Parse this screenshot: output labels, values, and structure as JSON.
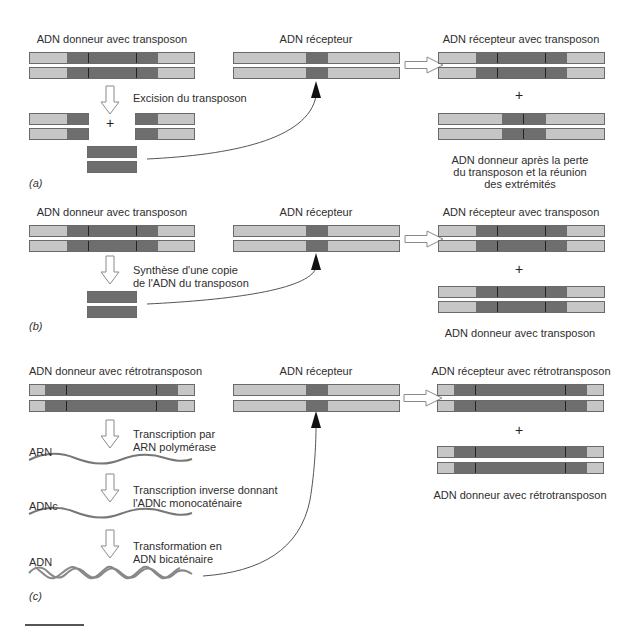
{
  "colors": {
    "light_dna": "#c6c6c6",
    "dark_segment": "#6e6e6e",
    "outline": "#6a6a6a",
    "curve": "#555555"
  },
  "panel_a": {
    "tag": "(a)",
    "donor_label": "ADN donneur avec transposon",
    "receptor_label": "ADN récepteur",
    "result_label": "ADN récepteur avec transposon",
    "step_label": "Excision du transposon",
    "plus": "+",
    "result_plus": "+",
    "donor_after_label_1": "ADN donneur après la perte",
    "donor_after_label_2": "du transposon et la réunion",
    "donor_after_label_3": "des extrémités"
  },
  "panel_b": {
    "tag": "(b)",
    "donor_label": "ADN donneur avec transposon",
    "receptor_label": "ADN récepteur",
    "result_label": "ADN récepteur avec transposon",
    "step_label_1": "Synthèse d'une copie",
    "step_label_2": "de l'ADN du transposon",
    "result_plus": "+",
    "donor_after_label": "ADN donneur avec transposon"
  },
  "panel_c": {
    "tag": "(c)",
    "donor_label": "ADN donneur avec rétrotransposon",
    "receptor_label": "ADN récepteur",
    "result_label": "ADN récepteur avec rétrotransposon",
    "step1_label_1": "Transcription par",
    "step1_label_2": "ARN polymérase",
    "rna_label": "ARN",
    "step2_label_1": "Transcription inverse donnant",
    "step2_label_2": "l'ADNc monocaténaire",
    "cdna_label": "ADNc",
    "step3_label_1": "Transformation en",
    "step3_label_2": "ADN bicaténaire",
    "dna_label": "ADN",
    "result_plus": "+",
    "donor_after_label": "ADN donneur avec rétrotransposon"
  }
}
